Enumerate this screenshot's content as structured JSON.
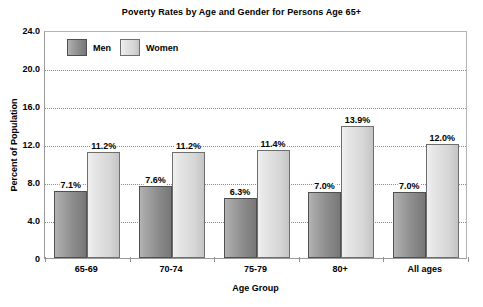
{
  "chart_data": {
    "type": "bar",
    "title": "Poverty Rates by Age and Gender for Persons Age 65+",
    "xlabel": "Age Group",
    "ylabel": "Percent of Population",
    "categories": [
      "65-69",
      "70-74",
      "75-79",
      "80+",
      "All ages"
    ],
    "series": [
      {
        "name": "Men",
        "color": "#8e8e8e",
        "values": [
          7.1,
          7.6,
          6.3,
          7.0,
          7.0
        ],
        "labels": [
          "7.1%",
          "7.6%",
          "6.3%",
          "7.0%",
          "7.0%"
        ]
      },
      {
        "name": "Women",
        "color": "#d6d6d6",
        "values": [
          11.2,
          11.2,
          11.4,
          13.9,
          12.0
        ],
        "labels": [
          "11.2%",
          "11.2%",
          "11.4%",
          "13.9%",
          "12.0%"
        ]
      }
    ],
    "ylim": [
      0,
      24
    ],
    "yticks": [
      0,
      4,
      8,
      12,
      16,
      20,
      24
    ],
    "ytick_labels": [
      "0",
      "4.0",
      "8.0",
      "12.0",
      "16.0",
      "20.0",
      "24.0"
    ],
    "grid": true,
    "grid_axis": "y",
    "legend_position": "top-left-inside"
  },
  "legend": {
    "entries": [
      {
        "label": "Men"
      },
      {
        "label": "Women"
      }
    ]
  }
}
